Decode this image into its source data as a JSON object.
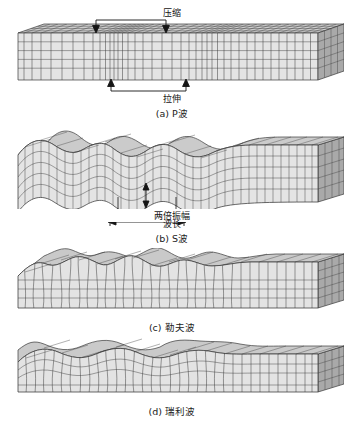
{
  "figure": {
    "background": "#ffffff",
    "line_color": "#3a3a3a",
    "fill_top": "#c9c9c9",
    "fill_front": "#e2e2e2",
    "fill_side": "#a8a8a8"
  },
  "panels": [
    {
      "id": "p-wave",
      "caption_tag": "(a)",
      "caption_text": "P波",
      "wave_kind": "compressional",
      "annotations": [
        {
          "name": "compression",
          "label": "压缩",
          "position": "above",
          "arrow": "down-both-ends"
        },
        {
          "name": "dilation",
          "label": "拉伸",
          "position": "below",
          "arrow": "up-both-ends"
        }
      ]
    },
    {
      "id": "s-wave",
      "caption_tag": "(b)",
      "caption_text": "S波",
      "wave_kind": "shear-vertical",
      "annotations": [
        {
          "name": "double-amplitude",
          "label": "两倍振幅",
          "position": "below",
          "arrow": "vertical-double"
        },
        {
          "name": "wavelength",
          "label": "波长",
          "position": "below",
          "arrow": "horizontal-double"
        }
      ]
    },
    {
      "id": "love-wave",
      "caption_tag": "(c)",
      "caption_text": "勒夫波",
      "wave_kind": "surface-horizontal-shear",
      "annotations": []
    },
    {
      "id": "rayleigh-wave",
      "caption_tag": "(d)",
      "caption_text": "瑞利波",
      "wave_kind": "surface-retrograde-elliptical",
      "annotations": []
    }
  ]
}
